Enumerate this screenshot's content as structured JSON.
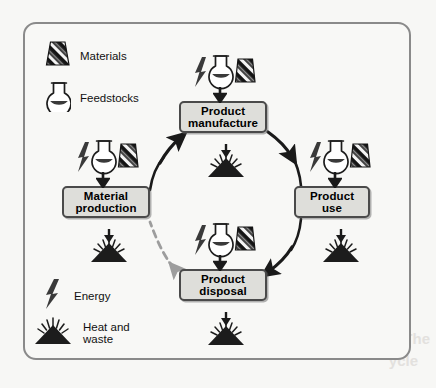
{
  "diagram": {
    "frame": {
      "border_color": "#8a8a8a",
      "background": "#f8f8f6"
    },
    "colors": {
      "box_fill": "#dededa",
      "box_border": "#4a4a4a",
      "arrow": "#1a1a1a",
      "recycle_arrow": "#9d9d9d",
      "material_dark": "#1c1c1c",
      "material_light": "#f2f2f2",
      "flask_fill": "#3a3a3a",
      "heat_fill": "#1c1c1c"
    },
    "stages": [
      {
        "id": "material-production",
        "label": "Material\nproduction"
      },
      {
        "id": "product-manufacture",
        "label": "Product\nmanufacture"
      },
      {
        "id": "product-use",
        "label": "Product\nuse"
      },
      {
        "id": "product-disposal",
        "label": "Product\ndisposal"
      }
    ],
    "legend": [
      {
        "id": "materials",
        "icon": "materials-trapezoid-icon",
        "label": "Materials"
      },
      {
        "id": "feedstocks",
        "icon": "flask-icon",
        "label": "Feedstocks"
      },
      {
        "id": "energy",
        "icon": "lightning-bolt-icon",
        "label": "Energy"
      },
      {
        "id": "heat-waste",
        "icon": "heat-waste-mound-icon",
        "label": "Heat and\nwaste"
      }
    ],
    "inputs": {
      "icons": [
        "lightning-bolt-icon",
        "flask-icon",
        "materials-trapezoid-icon"
      ],
      "applies_to": [
        "product-manufacture",
        "material-production",
        "product-use",
        "product-disposal"
      ]
    },
    "outputs": {
      "icon": "heat-waste-mound-icon",
      "applies_to": [
        "product-manufacture",
        "material-production",
        "product-use",
        "product-disposal"
      ]
    },
    "flows": [
      {
        "from": "material-production",
        "to": "product-manufacture",
        "style": "solid"
      },
      {
        "from": "product-manufacture",
        "to": "product-use",
        "style": "solid"
      },
      {
        "from": "product-use",
        "to": "product-disposal",
        "style": "solid"
      },
      {
        "from": "product-disposal",
        "to": "material-production",
        "style": "dashed",
        "meaning": "recycling"
      }
    ]
  },
  "bleed_text": {
    "line1": "The",
    "line2": "ycle"
  }
}
